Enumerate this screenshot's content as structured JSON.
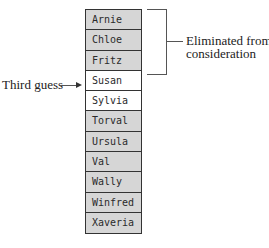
{
  "names": [
    {
      "label": "Arnie",
      "shade": "gray"
    },
    {
      "label": "Chloe",
      "shade": "gray"
    },
    {
      "label": "Fritz",
      "shade": "gray"
    },
    {
      "label": "Susan",
      "shade": "white"
    },
    {
      "label": "Sylvia",
      "shade": "white"
    },
    {
      "label": "Torval",
      "shade": "gray"
    },
    {
      "label": "Ursula",
      "shade": "gray"
    },
    {
      "label": "Val",
      "shade": "gray"
    },
    {
      "label": "Wally",
      "shade": "gray"
    },
    {
      "label": "Winfred",
      "shade": "gray"
    },
    {
      "label": "Xaveria",
      "shade": "gray"
    }
  ],
  "annotations": {
    "bracket_label_line1": "Eliminated from",
    "bracket_label_line2": "consideration",
    "pointer_label": "Third guess",
    "pointer_arrow": "→"
  },
  "colors": {
    "eliminated_fill": "#d6d6d6",
    "candidate_fill": "#ffffff",
    "border": "#333333"
  }
}
